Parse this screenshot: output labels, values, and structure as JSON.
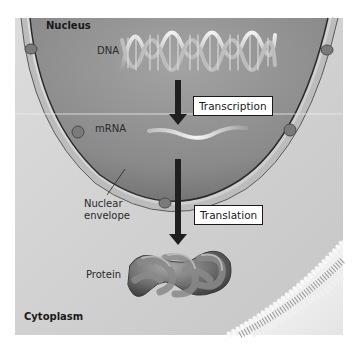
{
  "diagram": {
    "regions": {
      "nucleus": "Nucleus",
      "cytoplasm": "Cytoplasm"
    },
    "molecules": {
      "dna": "DNA",
      "mrna": "mRNA",
      "protein": "Protein"
    },
    "structures": {
      "nuclear_envelope": "Nuclear\nenvelope",
      "nuclear_envelope_line1": "Nuclear",
      "nuclear_envelope_line2": "envelope"
    },
    "processes": {
      "transcription": "Transcription",
      "translation": "Translation"
    },
    "flow": [
      {
        "from": "DNA",
        "to": "mRNA",
        "process": "Transcription"
      },
      {
        "from": "mRNA",
        "to": "Protein",
        "process": "Translation"
      }
    ],
    "colors": {
      "background": "#d8d8d8",
      "nucleus_fill": "#8f8f8f",
      "envelope": "#b9b9b9",
      "arrow": "#1f1f1f",
      "label_box_border": "#1a1a1a"
    }
  }
}
